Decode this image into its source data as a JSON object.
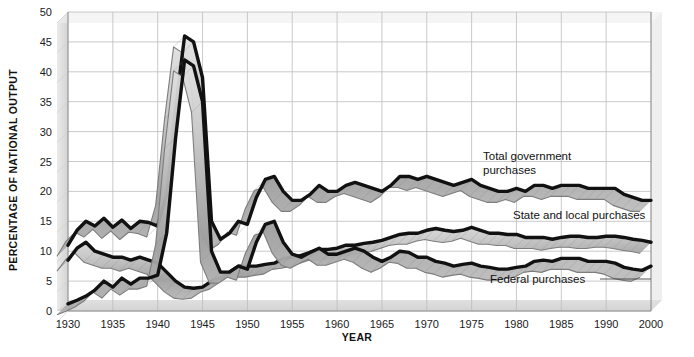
{
  "chart_data": {
    "type": "line",
    "title": "",
    "xlabel": "YEAR",
    "ylabel": "PERCENTAGE OF NATIONAL OUTPUT",
    "xlim": [
      1930,
      1995
    ],
    "ylim": [
      0,
      50
    ],
    "grid": true,
    "legend_position": "inline-annotations",
    "y_ticks": [
      0,
      5,
      10,
      15,
      20,
      25,
      30,
      35,
      40,
      45,
      50
    ],
    "x_ticks": [
      1930,
      1935,
      1940,
      1945,
      1950,
      1955,
      1960,
      1965,
      1970,
      1975,
      1980,
      1985,
      1990,
      2000
    ],
    "x_tick_labels": [
      "1930",
      "1935",
      "1940",
      "1945",
      "1950",
      "1955",
      "1960",
      "1965",
      "1970",
      "1975",
      "1980",
      "1985",
      "1990",
      "2000"
    ],
    "x": [
      1930,
      1931,
      1932,
      1933,
      1934,
      1935,
      1936,
      1937,
      1938,
      1939,
      1940,
      1941,
      1942,
      1943,
      1944,
      1945,
      1946,
      1947,
      1948,
      1949,
      1950,
      1951,
      1952,
      1953,
      1954,
      1955,
      1956,
      1957,
      1958,
      1959,
      1960,
      1961,
      1962,
      1963,
      1964,
      1965,
      1966,
      1967,
      1968,
      1969,
      1970,
      1971,
      1972,
      1973,
      1974,
      1975,
      1976,
      1977,
      1978,
      1979,
      1980,
      1981,
      1982,
      1983,
      1984,
      1985,
      1986,
      1987,
      1988,
      1989,
      1990,
      1991,
      1992,
      1993,
      1994,
      1995
    ],
    "series": [
      {
        "name": "Total government purchases",
        "color": "#111111",
        "values": [
          11.0,
          13.5,
          15.0,
          14.2,
          15.5,
          14.0,
          15.2,
          13.8,
          15.0,
          14.8,
          14.2,
          19.5,
          34.0,
          46.0,
          45.0,
          39.0,
          15.0,
          12.0,
          13.0,
          15.0,
          14.5,
          19.0,
          22.0,
          22.5,
          20.0,
          18.5,
          18.5,
          19.5,
          21.0,
          20.0,
          20.0,
          21.0,
          21.5,
          21.0,
          20.5,
          20.0,
          21.0,
          22.5,
          22.5,
          22.0,
          22.5,
          22.0,
          21.5,
          21.0,
          21.5,
          22.0,
          21.0,
          20.5,
          20.0,
          20.0,
          20.5,
          20.0,
          21.0,
          21.0,
          20.5,
          21.0,
          21.0,
          21.0,
          20.5,
          20.5,
          20.5,
          20.5,
          19.5,
          19.0,
          18.5,
          18.5
        ]
      },
      {
        "name": "State and local purchases",
        "color": "#111111",
        "values": [
          8.5,
          10.5,
          11.5,
          10.0,
          9.5,
          9.0,
          9.0,
          8.5,
          9.0,
          8.5,
          8.0,
          6.5,
          5.0,
          4.0,
          3.8,
          4.0,
          5.0,
          5.5,
          6.5,
          7.5,
          7.5,
          7.5,
          7.8,
          8.0,
          8.8,
          9.0,
          9.3,
          9.8,
          10.3,
          10.3,
          10.5,
          11.0,
          11.0,
          11.3,
          11.5,
          11.8,
          12.3,
          12.8,
          13.0,
          13.0,
          13.5,
          13.8,
          13.5,
          13.3,
          13.5,
          14.0,
          13.5,
          13.0,
          13.0,
          12.8,
          12.8,
          12.3,
          12.3,
          12.3,
          12.0,
          12.3,
          12.5,
          12.5,
          12.3,
          12.3,
          12.5,
          12.5,
          12.3,
          12.0,
          11.8,
          11.5
        ]
      },
      {
        "name": "Federal purchases",
        "color": "#111111",
        "values": [
          1.2,
          1.8,
          2.5,
          3.5,
          5.0,
          4.0,
          5.5,
          4.5,
          5.5,
          5.5,
          6.0,
          13.0,
          29.0,
          42.0,
          41.0,
          35.0,
          10.0,
          6.5,
          6.5,
          7.5,
          7.0,
          11.5,
          14.5,
          15.0,
          11.5,
          9.5,
          9.0,
          9.8,
          10.5,
          9.5,
          9.5,
          10.0,
          10.5,
          10.0,
          9.0,
          8.3,
          9.0,
          10.0,
          9.8,
          9.0,
          9.0,
          8.3,
          8.0,
          7.5,
          7.8,
          8.0,
          7.5,
          7.3,
          7.0,
          7.0,
          7.3,
          7.5,
          8.3,
          8.5,
          8.3,
          8.8,
          8.8,
          8.8,
          8.3,
          8.3,
          8.3,
          8.0,
          7.3,
          7.0,
          6.8,
          7.5
        ]
      }
    ],
    "annotations": [
      {
        "text_line1": "Total government",
        "text_line2": "purchases",
        "series": "Total government purchases"
      },
      {
        "text_line1": "State and local purchases",
        "text_line2": "",
        "series": "State and local purchases"
      },
      {
        "text_line1": "Federal purchases",
        "text_line2": "",
        "series": "Federal purchases"
      }
    ]
  },
  "axes": {
    "y_label": "PERCENTAGE OF NATIONAL OUTPUT",
    "x_label": "YEAR",
    "y_tick_labels": [
      "0",
      "5",
      "10",
      "15",
      "20",
      "25",
      "30",
      "35",
      "40",
      "45",
      "50"
    ],
    "x_tick_labels": [
      "1930",
      "1935",
      "1940",
      "1945",
      "1950",
      "1955",
      "1960",
      "1965",
      "1970",
      "1975",
      "1980",
      "1985",
      "1990",
      "2000"
    ]
  },
  "annotations": {
    "total_line1": "Total government",
    "total_line2": "purchases",
    "state_local": "State and local purchases",
    "federal": "Federal purchases"
  },
  "colors": {
    "line": "#111111",
    "grid": "#bdbdbd",
    "axis": "#8c8c8c",
    "ribbon_light": "#e2e2e2",
    "ribbon_mid": "#b4b4b4",
    "ribbon_dark": "#8f8f8f",
    "background": "#ffffff"
  }
}
